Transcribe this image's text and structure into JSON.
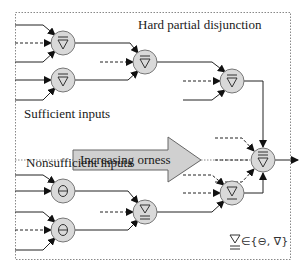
{
  "labels": {
    "title": "Hard partial disjunction",
    "sufficient": "Sufficient inputs",
    "nonsufficient": "Nonsufficient inputs",
    "arrow": "Increasing orness"
  },
  "legend": {
    "text": "∈{⊖, ∇}",
    "symbol": "double-underlined nabla"
  },
  "colors": {
    "node_fill": "#d9d9d9",
    "node_stroke": "#777777",
    "line": "#222222",
    "arrow_fill": "#d0d0d0",
    "border": "#888888"
  },
  "nodes": [
    {
      "id": "a1",
      "type": "hard-disjunction",
      "x": 63,
      "y": 43
    },
    {
      "id": "a2",
      "type": "hard-disjunction",
      "x": 63,
      "y": 80
    },
    {
      "id": "b1",
      "type": "hard-disjunction",
      "x": 145,
      "y": 62
    },
    {
      "id": "c1",
      "type": "hard-disjunction",
      "x": 232,
      "y": 81
    },
    {
      "id": "final",
      "type": "strong-hard-disjunction",
      "x": 263,
      "y": 160
    },
    {
      "id": "d1",
      "type": "neutral",
      "x": 63,
      "y": 191
    },
    {
      "id": "d2",
      "type": "neutral",
      "x": 63,
      "y": 230
    },
    {
      "id": "e1",
      "type": "soft-disjunction-variable",
      "x": 145,
      "y": 212
    },
    {
      "id": "f1",
      "type": "soft-disjunction",
      "x": 232,
      "y": 193
    }
  ]
}
